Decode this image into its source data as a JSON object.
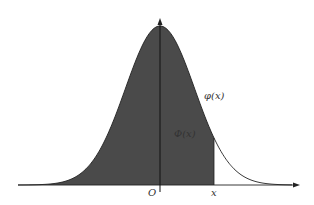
{
  "figure": {
    "title": "",
    "curve_label": "φ(x)",
    "area_label": "Φ(x)",
    "origin_label": "O",
    "x_marker_label": "x"
  },
  "colors": {
    "fill": "#4a4a4a",
    "curve": "#222222",
    "axis": "#222222",
    "background": "#ffffff"
  },
  "geometry": {
    "origin_x": 160,
    "axis_y": 185,
    "peak_y": 26,
    "sigma_px": 34.6,
    "x_marker_px": 214,
    "x_start": 18,
    "x_end": 300,
    "y_top": 18
  }
}
